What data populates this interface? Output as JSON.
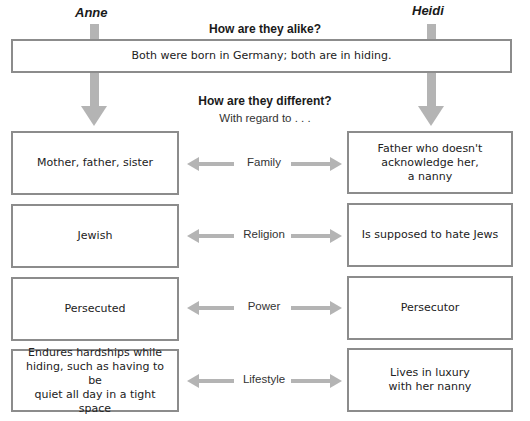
{
  "columns": {
    "left": "Anne",
    "right": "Heidi"
  },
  "alike": {
    "heading": "How are they alike?",
    "text": "Both were born in Germany; both are in hiding."
  },
  "different": {
    "heading": "How are they different?",
    "subheading": "With regard to . . ."
  },
  "rows": [
    {
      "category": "Family",
      "anne": "Mother, father, sister",
      "heidi": "Father who doesn't\nacknowledge her,\na nanny"
    },
    {
      "category": "Religion",
      "anne": "Jewish",
      "heidi": "Is supposed to hate Jews"
    },
    {
      "category": "Power",
      "anne": "Persecuted",
      "heidi": "Persecutor"
    },
    {
      "category": "Lifestyle",
      "anne": "Endures hardships while\nhiding, such as having to be\nquiet all day in a tight space",
      "heidi": "Lives in luxury\nwith her nanny"
    }
  ],
  "colors": {
    "border": "#8c8c8c",
    "arrow": "#b4b4b4"
  }
}
